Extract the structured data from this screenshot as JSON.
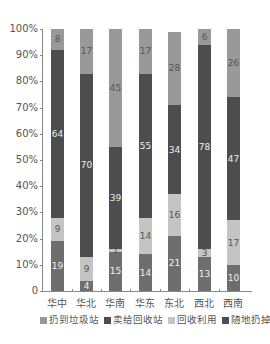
{
  "chart_data": {
    "type": "bar",
    "stacked": true,
    "normalized": true,
    "title": "",
    "xlabel": "",
    "ylabel": "",
    "ylim": [
      0,
      100
    ],
    "yticks": [
      "0",
      "10%",
      "20%",
      "30%",
      "40%",
      "50%",
      "60%",
      "70%",
      "80%",
      "90%",
      "100%"
    ],
    "categories": [
      "华中",
      "华北",
      "华南",
      "华东",
      "东北",
      "西北",
      "西南"
    ],
    "series": [
      {
        "name": "随地扔掉",
        "color": "#6e6e6e",
        "values": [
          19,
          4,
          15,
          14,
          21,
          13,
          10
        ]
      },
      {
        "name": "回收利用",
        "color": "#c4c4c4",
        "values": [
          9,
          9,
          1,
          14,
          16,
          3,
          17
        ]
      },
      {
        "name": "卖给回收站",
        "color": "#4d4d4d",
        "values": [
          64,
          70,
          39,
          55,
          34,
          78,
          47
        ]
      },
      {
        "name": "扔到垃圾站",
        "color": "#999999",
        "values": [
          8,
          17,
          45,
          17,
          28,
          6,
          26
        ]
      }
    ],
    "legend": {
      "position": "bottom",
      "entries": [
        {
          "label": "扔到垃圾站",
          "color": "#999999"
        },
        {
          "label": "卖给回收站",
          "color": "#4d4d4d"
        },
        {
          "label": "回收利用",
          "color": "#c4c4c4"
        },
        {
          "label": "随地扔掉",
          "color": "#4d4d4d"
        }
      ]
    },
    "grid": false
  }
}
